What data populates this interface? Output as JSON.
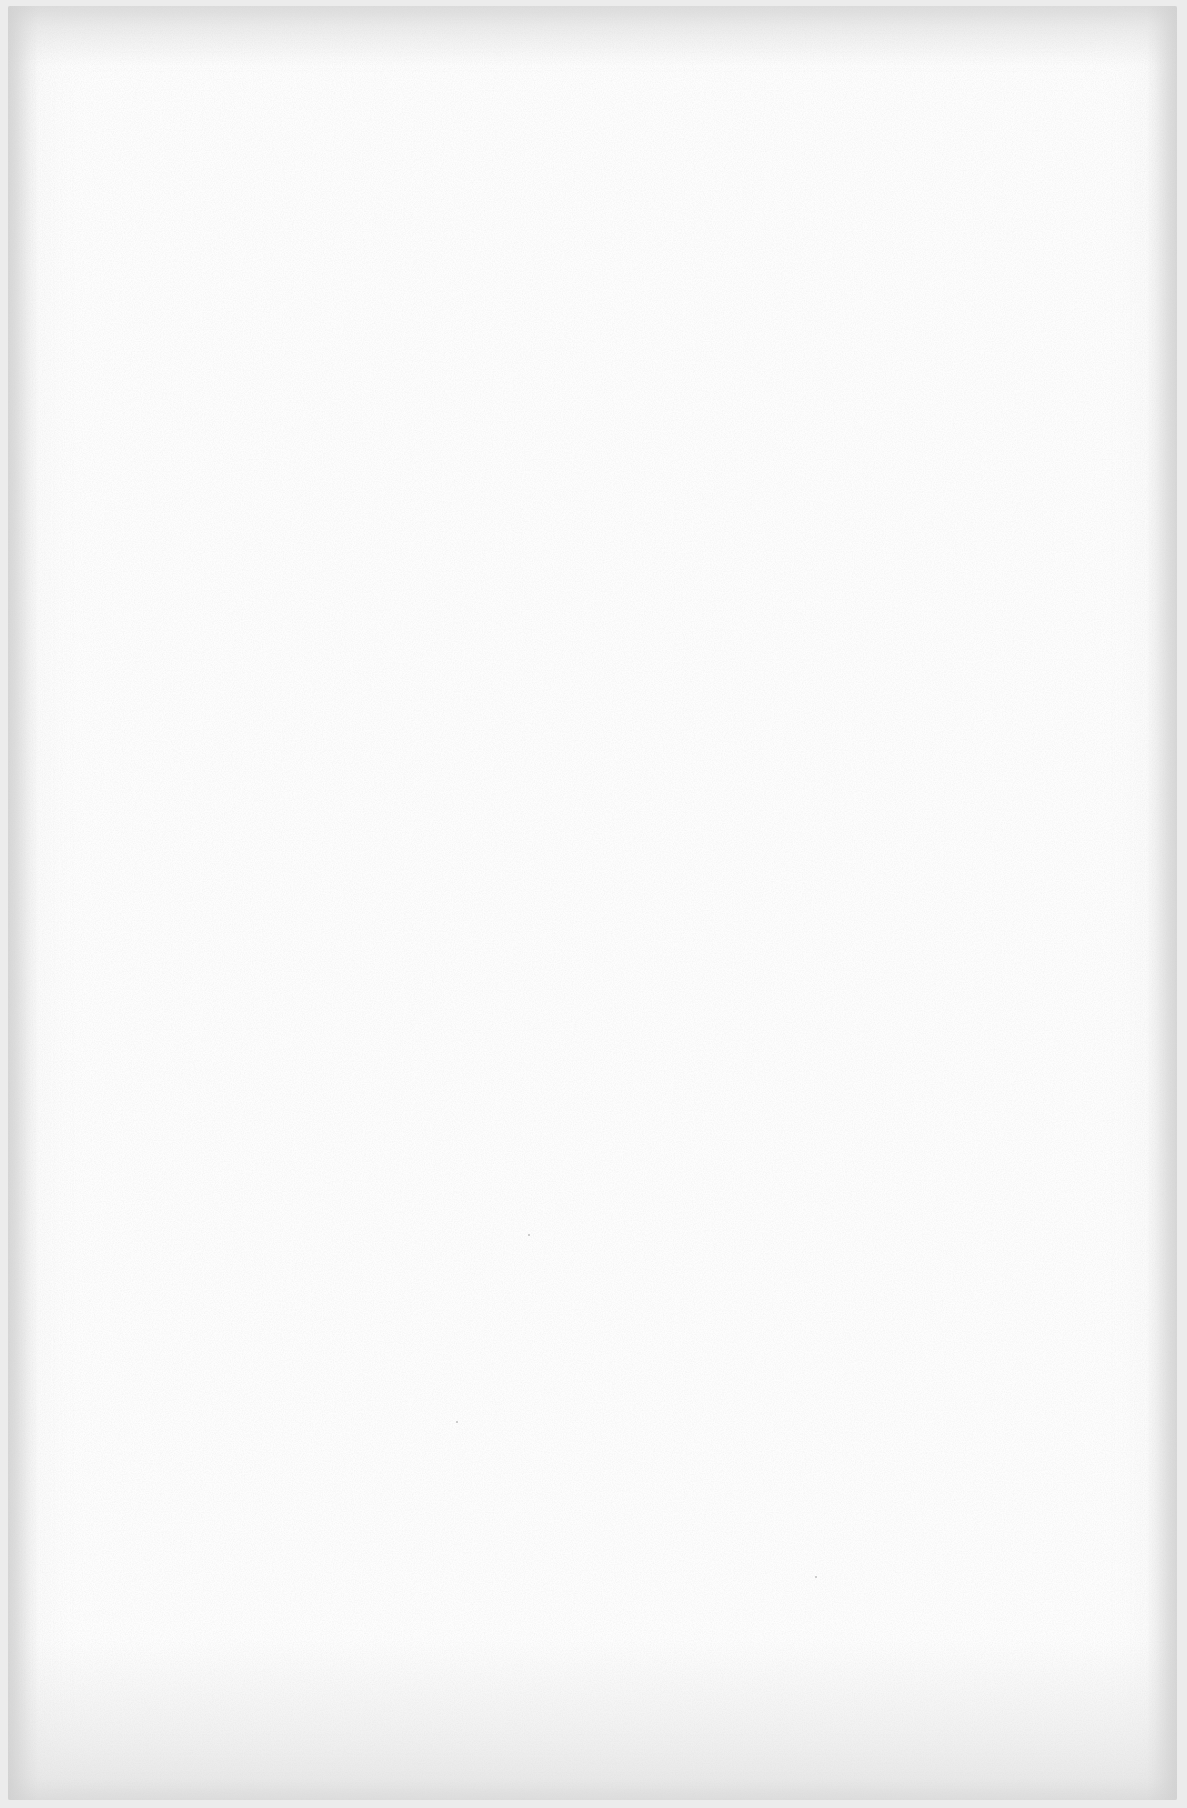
{
  "document": {
    "type": "blank scanned page",
    "text": "",
    "colors": {
      "paper": "#fdfdfd",
      "edge_shadow": "#d4d4d4",
      "background": "#ececec"
    }
  }
}
